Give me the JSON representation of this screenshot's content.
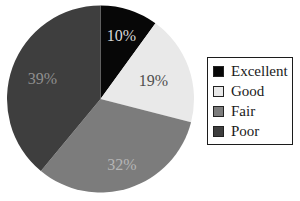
{
  "chart_data": {
    "type": "pie",
    "title": "",
    "categories": [
      "Excellent",
      "Good",
      "Fair",
      "Poor"
    ],
    "values": [
      10,
      19,
      32,
      39
    ],
    "labels": [
      "10%",
      "19%",
      "32%",
      "39%"
    ],
    "colors": [
      "#070707",
      "#e9e9e9",
      "#7c7c7c",
      "#3e3e3e"
    ],
    "label_colors": [
      "#d8d8d8",
      "#4f4f4f",
      "#b5b5b5",
      "#8f8f8f"
    ],
    "label_radius_frac": [
      0.72,
      0.6,
      0.74,
      0.66
    ],
    "start_angle_deg": 0,
    "direction": "clockwise",
    "legend_position": "right",
    "legend_border_color": "#1c1c1c",
    "background_color": "#ffffff"
  },
  "legend": {
    "items": [
      {
        "label": "Excellent"
      },
      {
        "label": "Good"
      },
      {
        "label": "Fair"
      },
      {
        "label": "Poor"
      }
    ]
  }
}
